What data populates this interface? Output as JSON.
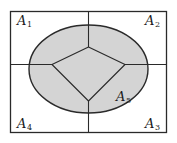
{
  "diagram": {
    "type": "partitioned-rectangle-with-ellipse",
    "colors": {
      "background": "#ffffff",
      "stroke": "#2a2a2a",
      "ellipse_fill": "#d4d4d4"
    },
    "regions": [
      {
        "id": "A1",
        "letter": "A",
        "subscript": "1",
        "position": "top-left"
      },
      {
        "id": "A2",
        "letter": "A",
        "subscript": "2",
        "position": "top-right"
      },
      {
        "id": "A3",
        "letter": "A",
        "subscript": "3",
        "position": "bottom-right"
      },
      {
        "id": "A4",
        "letter": "A",
        "subscript": "4",
        "position": "bottom-left"
      },
      {
        "id": "A5",
        "letter": "A",
        "subscript": "5",
        "position": "ellipse (shaded)"
      }
    ]
  },
  "labels": {
    "a1": {
      "letter": "A",
      "sub": "1"
    },
    "a2": {
      "letter": "A",
      "sub": "2"
    },
    "a3": {
      "letter": "A",
      "sub": "3"
    },
    "a4": {
      "letter": "A",
      "sub": "4"
    },
    "a5": {
      "letter": "A",
      "sub": "5"
    }
  }
}
